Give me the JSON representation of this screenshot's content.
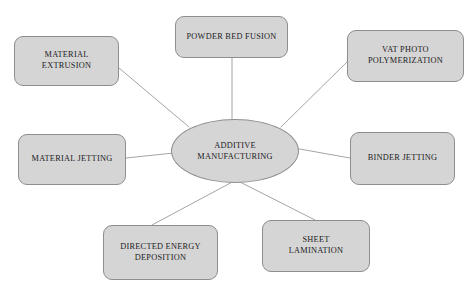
{
  "diagram": {
    "type": "hub-and-spoke",
    "colors": {
      "node_fill": "#d5d5d5",
      "node_border": "#8e8e8e",
      "text": "#1b1b22",
      "background": "#ffffff",
      "connector": "#9a9a9a"
    },
    "hub": {
      "id": "additive-manufacturing",
      "label": "ADDITIVE\nMANUFACTURING",
      "shape": "ellipse",
      "cx": 234,
      "cy": 150,
      "rx": 63,
      "ry": 31
    },
    "nodes": [
      {
        "id": "material-extrusion",
        "label": "MATERIAL\nEXTRUSION",
        "shape": "rounded-rect",
        "x": 14,
        "y": 36,
        "w": 105,
        "h": 50,
        "position": "top-left"
      },
      {
        "id": "powder-bed-fusion",
        "label": "POWDER BED FUSION",
        "shape": "rounded-rect",
        "x": 175,
        "y": 16,
        "w": 113,
        "h": 42,
        "position": "top-center"
      },
      {
        "id": "vat-photo-polymerization",
        "label": "VAT PHOTO\nPOLYMERIZATION",
        "shape": "rounded-rect",
        "x": 347,
        "y": 30,
        "w": 117,
        "h": 52,
        "position": "top-right"
      },
      {
        "id": "material-jetting",
        "label": "MATERIAL JETTING",
        "shape": "rounded-rect",
        "x": 18,
        "y": 134,
        "w": 108,
        "h": 51,
        "position": "middle-left"
      },
      {
        "id": "binder-jetting",
        "label": "BINDER JETTING",
        "shape": "rounded-rect",
        "x": 350,
        "y": 132,
        "w": 105,
        "h": 53,
        "position": "middle-right"
      },
      {
        "id": "directed-energy-deposition",
        "label": "DIRECTED ENERGY\nDEPOSITION",
        "shape": "rounded-rect",
        "x": 103,
        "y": 225,
        "w": 115,
        "h": 55,
        "position": "bottom-left"
      },
      {
        "id": "sheet-lamination",
        "label": "SHEET\nLAMINATION",
        "shape": "rounded-rect",
        "x": 262,
        "y": 220,
        "w": 108,
        "h": 52,
        "position": "bottom-right"
      }
    ],
    "connectors": [
      {
        "id": "hub-to-material-extrusion",
        "from": "additive-manufacturing",
        "to": "material-extrusion",
        "x1": 189,
        "y1": 127,
        "x2": 119,
        "y2": 68
      },
      {
        "id": "hub-to-powder-bed-fusion",
        "from": "additive-manufacturing",
        "to": "powder-bed-fusion",
        "x1": 232,
        "y1": 120,
        "x2": 232,
        "y2": 58
      },
      {
        "id": "hub-to-vat-photo-polymerization",
        "from": "additive-manufacturing",
        "to": "vat-photo-polymerization",
        "x1": 281,
        "y1": 127,
        "x2": 347,
        "y2": 62
      },
      {
        "id": "hub-to-material-jetting",
        "from": "additive-manufacturing",
        "to": "material-jetting",
        "x1": 174,
        "y1": 153,
        "x2": 126,
        "y2": 158
      },
      {
        "id": "hub-to-binder-jetting",
        "from": "additive-manufacturing",
        "to": "binder-jetting",
        "x1": 294,
        "y1": 148,
        "x2": 350,
        "y2": 158
      },
      {
        "id": "hub-to-directed-energy-deposition",
        "from": "additive-manufacturing",
        "to": "directed-energy-deposition",
        "x1": 236,
        "y1": 180,
        "x2": 152,
        "y2": 225
      },
      {
        "id": "hub-to-sheet-lamination",
        "from": "additive-manufacturing",
        "to": "sheet-lamination",
        "x1": 236,
        "y1": 180,
        "x2": 315,
        "y2": 220
      }
    ]
  }
}
